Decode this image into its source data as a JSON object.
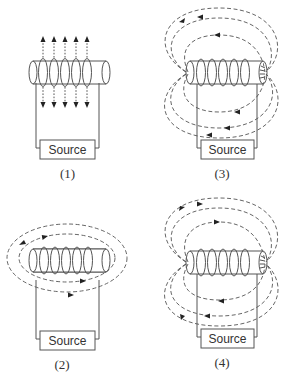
{
  "panels": [
    {
      "id": "1",
      "label": "(1)",
      "source_label": "Source",
      "field_pattern": "vertical-arrows-through-coils"
    },
    {
      "id": "2",
      "label": "(2)",
      "source_label": "Source",
      "field_pattern": "loops-around-coil-horizontal"
    },
    {
      "id": "3",
      "label": "(3)",
      "source_label": "Source",
      "field_pattern": "dipole-loops-arrows-left"
    },
    {
      "id": "4",
      "label": "(4)",
      "source_label": "Source",
      "field_pattern": "dipole-loops-arrows-mixed"
    }
  ],
  "colors": {
    "line": "#555555",
    "arrow": "#222222",
    "text": "#333333",
    "background": "#ffffff"
  }
}
